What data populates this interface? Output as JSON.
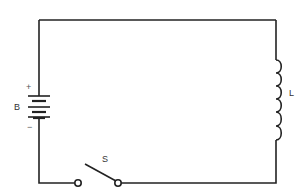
{
  "diagram": {
    "type": "circuit",
    "components": [
      {
        "id": "battery",
        "label": "B",
        "positive_symbol": "+",
        "negative_symbol": "−"
      },
      {
        "id": "inductor",
        "label": "L"
      },
      {
        "id": "switch",
        "label": "S",
        "state": "open"
      }
    ],
    "colors": {
      "wire": "#222222",
      "background": "#ffffff"
    }
  }
}
